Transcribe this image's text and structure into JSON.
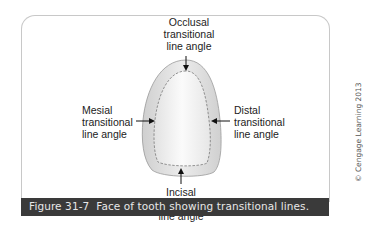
{
  "figure": {
    "caption_number": "Figure 31-7",
    "caption_text": "Face of tooth showing transitional lines.",
    "credit": "© Cengage Learning 2013"
  },
  "labels": {
    "occlusal": [
      "Occlusal",
      "transitional",
      "line angle"
    ],
    "mesial": [
      "Mesial",
      "transitional",
      "line angle"
    ],
    "distal": [
      "Distal",
      "transitional",
      "line angle"
    ],
    "incisal": [
      "Incisal",
      "transitional",
      "line angle"
    ]
  },
  "colors": {
    "caption_bg": "#3a3a3a",
    "caption_text": "#e8e8e8",
    "tooth_outer": "#d9d9d9",
    "tooth_inner": "#f2f2f2"
  }
}
